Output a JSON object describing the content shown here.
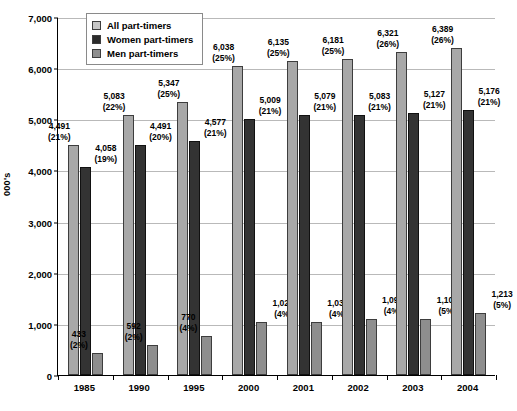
{
  "chart_data": {
    "type": "bar",
    "title": "",
    "xlabel": "",
    "ylabel": "000's",
    "ylim": [
      0,
      7000
    ],
    "ytick_step": 1000,
    "grid": true,
    "legend_position": "top-left",
    "categories": [
      "1985",
      "1990",
      "1995",
      "2000",
      "2001",
      "2002",
      "2003",
      "2004"
    ],
    "ytick_labels": [
      "7,000",
      "6,000",
      "5,000",
      "4,000",
      "3,000",
      "2,000",
      "1,000",
      "0"
    ],
    "series": [
      {
        "name": "All part-timers",
        "color": "#a8a8a8",
        "values": [
          4491,
          5083,
          5347,
          6038,
          6135,
          6181,
          6321,
          6389
        ],
        "value_labels": [
          "4,491",
          "5,083",
          "5,347",
          "6,038",
          "6,135",
          "6,181",
          "6,321",
          "6,389"
        ],
        "pct_labels": [
          "(21%)",
          "(22%)",
          "(25%)",
          "(25%)",
          "(25%)",
          "(25%)",
          "(26%)",
          "(26%)"
        ]
      },
      {
        "name": "Women part-timers",
        "color": "#333333",
        "values": [
          4058,
          4491,
          4577,
          5009,
          5079,
          5083,
          5127,
          5176
        ],
        "value_labels": [
          "4,058",
          "4,491",
          "4,577",
          "5,009",
          "5,079",
          "5,083",
          "5,127",
          "5,176"
        ],
        "pct_labels": [
          "(19%)",
          "(20%)",
          "(21%)",
          "(21%)",
          "(21%)",
          "(21%)",
          "(21%)",
          "(21%)"
        ]
      },
      {
        "name": "Men part-timers",
        "color": "#8e8e8e",
        "values": [
          433,
          592,
          770,
          1029,
          1036,
          1098,
          1104,
          1213
        ],
        "value_labels": [
          "433",
          "592",
          "770",
          "1,029",
          "1,036",
          "1,098",
          "1,104",
          "1,213"
        ],
        "pct_labels": [
          "(2%)",
          "(2%)",
          "(4%)",
          "(4%)",
          "(4%)",
          "(4%)",
          "(5%)",
          "(5%)"
        ]
      }
    ]
  },
  "legend": {
    "items": [
      {
        "label": "All part-timers",
        "key": "all"
      },
      {
        "label": "Women part-timers",
        "key": "women"
      },
      {
        "label": "Men part-timers",
        "key": "men"
      }
    ]
  }
}
